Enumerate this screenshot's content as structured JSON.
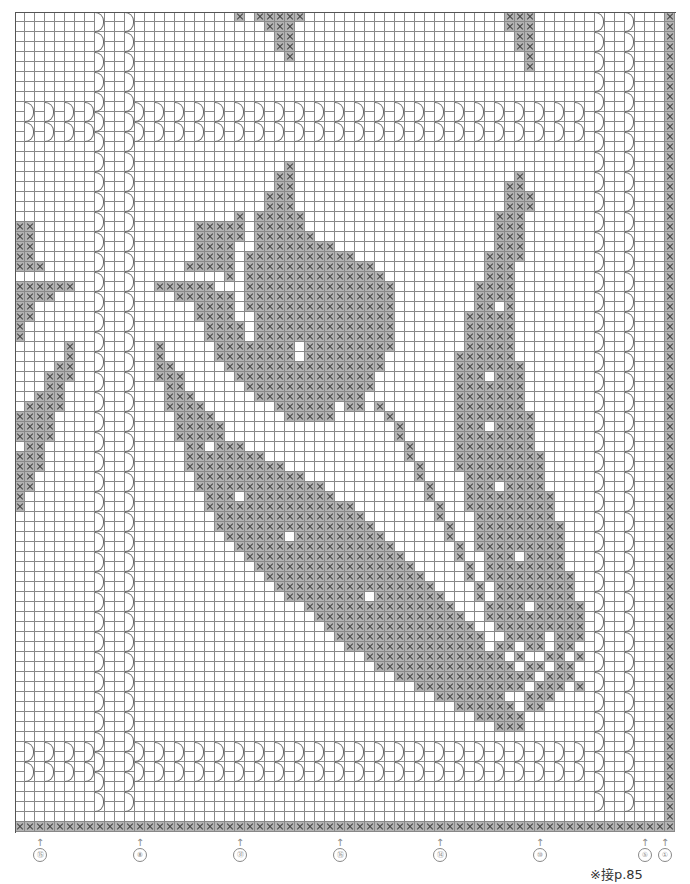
{
  "chart_info": {
    "type": "filet crochet chart",
    "cols": 66,
    "rows": 82,
    "cell_px": 10,
    "fill_color": "#b4b4b4",
    "line_color": "#888888"
  },
  "arch_columns": {
    "full_height": [
      8,
      11
    ],
    "top_band": {
      "rows": [
        9,
        12
      ],
      "cols": [
        1,
        3,
        5,
        7,
        12,
        14,
        16,
        18,
        20,
        22,
        24,
        26,
        28,
        30,
        32,
        34,
        36,
        38,
        40,
        42,
        44,
        46,
        48,
        50,
        52,
        54,
        56,
        58
      ]
    },
    "bottom_band": {
      "rows": [
        73,
        76
      ],
      "cols": [
        1,
        3,
        5,
        7,
        12,
        14,
        16,
        18,
        20,
        22,
        24,
        26,
        28,
        30,
        32,
        34,
        36,
        38,
        40,
        42,
        44,
        46,
        48,
        50,
        52,
        54,
        56,
        58
      ]
    },
    "right_full": [
      58,
      61
    ]
  },
  "filled_rows": {
    "0": [
      [
        22,
        22
      ],
      [
        24,
        28
      ],
      [
        49,
        51
      ]
    ],
    "1": [
      [
        25,
        27
      ],
      [
        49,
        51
      ]
    ],
    "2": [
      [
        26,
        27
      ],
      [
        50,
        51
      ]
    ],
    "3": [
      [
        26,
        27
      ],
      [
        50,
        51
      ]
    ],
    "4": [
      [
        27,
        27
      ],
      [
        51,
        51
      ]
    ],
    "5": [
      [
        51,
        51
      ]
    ],
    "15": [
      [
        27,
        27
      ]
    ],
    "16": [
      [
        26,
        27
      ],
      [
        50,
        50
      ]
    ],
    "17": [
      [
        26,
        27
      ],
      [
        49,
        50
      ]
    ],
    "18": [
      [
        25,
        27
      ],
      [
        49,
        51
      ]
    ],
    "19": [
      [
        25,
        27
      ],
      [
        49,
        51
      ]
    ],
    "20": [
      [
        22,
        22
      ],
      [
        24,
        28
      ],
      [
        48,
        50
      ]
    ],
    "21": [
      [
        0,
        1
      ],
      [
        18,
        22
      ],
      [
        24,
        28
      ],
      [
        48,
        50
      ]
    ],
    "22": [
      [
        0,
        1
      ],
      [
        18,
        22
      ],
      [
        24,
        29
      ],
      [
        48,
        50
      ]
    ],
    "23": [
      [
        0,
        1
      ],
      [
        18,
        21
      ],
      [
        24,
        31
      ],
      [
        48,
        50
      ]
    ],
    "24": [
      [
        0,
        1
      ],
      [
        18,
        21
      ],
      [
        23,
        33
      ],
      [
        47,
        50
      ]
    ],
    "25": [
      [
        0,
        2
      ],
      [
        17,
        21
      ],
      [
        23,
        35
      ],
      [
        47,
        49
      ]
    ],
    "26": [
      [
        21,
        21
      ],
      [
        23,
        36
      ],
      [
        47,
        49
      ]
    ],
    "27": [
      [
        0,
        5
      ],
      [
        14,
        19
      ],
      [
        23,
        37
      ],
      [
        46,
        49
      ]
    ],
    "28": [
      [
        0,
        3
      ],
      [
        16,
        21
      ],
      [
        23,
        37
      ],
      [
        46,
        49
      ]
    ],
    "29": [
      [
        0,
        1
      ],
      [
        18,
        21
      ],
      [
        23,
        37
      ],
      [
        46,
        47
      ],
      [
        49,
        49
      ]
    ],
    "30": [
      [
        0,
        1
      ],
      [
        18,
        21
      ],
      [
        24,
        37
      ],
      [
        45,
        49
      ]
    ],
    "31": [
      [
        0,
        0
      ],
      [
        19,
        22
      ],
      [
        24,
        37
      ],
      [
        45,
        49
      ]
    ],
    "32": [
      [
        0,
        0
      ],
      [
        19,
        22
      ],
      [
        24,
        37
      ],
      [
        45,
        49
      ]
    ],
    "33": [
      [
        5,
        5
      ],
      [
        14,
        14
      ],
      [
        20,
        27
      ],
      [
        29,
        37
      ],
      [
        45,
        49
      ]
    ],
    "34": [
      [
        5,
        5
      ],
      [
        14,
        14
      ],
      [
        20,
        27
      ],
      [
        29,
        36
      ],
      [
        44,
        49
      ]
    ],
    "35": [
      [
        4,
        5
      ],
      [
        14,
        15
      ],
      [
        21,
        36
      ],
      [
        44,
        50
      ]
    ],
    "36": [
      [
        3,
        5
      ],
      [
        14,
        16
      ],
      [
        22,
        35
      ],
      [
        44,
        46
      ],
      [
        48,
        50
      ]
    ],
    "37": [
      [
        3,
        4
      ],
      [
        15,
        16
      ],
      [
        23,
        35
      ],
      [
        44,
        50
      ]
    ],
    "38": [
      [
        2,
        4
      ],
      [
        15,
        17
      ],
      [
        24,
        34
      ],
      [
        44,
        50
      ]
    ],
    "39": [
      [
        1,
        4
      ],
      [
        15,
        18
      ],
      [
        26,
        31
      ],
      [
        33,
        34
      ],
      [
        36,
        36
      ],
      [
        44,
        50
      ]
    ],
    "40": [
      [
        0,
        3
      ],
      [
        16,
        19
      ],
      [
        27,
        31
      ],
      [
        37,
        37
      ],
      [
        44,
        51
      ]
    ],
    "41": [
      [
        0,
        3
      ],
      [
        16,
        20
      ],
      [
        38,
        38
      ],
      [
        44,
        46
      ],
      [
        48,
        51
      ]
    ],
    "42": [
      [
        0,
        3
      ],
      [
        16,
        20
      ],
      [
        38,
        38
      ],
      [
        44,
        51
      ]
    ],
    "43": [
      [
        1,
        2
      ],
      [
        17,
        18
      ],
      [
        20,
        22
      ],
      [
        39,
        39
      ],
      [
        44,
        51
      ]
    ],
    "44": [
      [
        0,
        2
      ],
      [
        17,
        24
      ],
      [
        39,
        39
      ],
      [
        44,
        52
      ]
    ],
    "45": [
      [
        0,
        2
      ],
      [
        17,
        26
      ],
      [
        40,
        40
      ],
      [
        44,
        52
      ]
    ],
    "46": [
      [
        0,
        1
      ],
      [
        18,
        28
      ],
      [
        40,
        40
      ],
      [
        45,
        52
      ]
    ],
    "47": [
      [
        0,
        1
      ],
      [
        18,
        30
      ],
      [
        41,
        41
      ],
      [
        45,
        47
      ],
      [
        49,
        52
      ]
    ],
    "48": [
      [
        0,
        0
      ],
      [
        19,
        21
      ],
      [
        23,
        31
      ],
      [
        41,
        41
      ],
      [
        45,
        53
      ]
    ],
    "49": [
      [
        0,
        0
      ],
      [
        19,
        33
      ],
      [
        42,
        42
      ],
      [
        45,
        53
      ]
    ],
    "50": [
      [
        20,
        34
      ],
      [
        42,
        42
      ],
      [
        46,
        53
      ]
    ],
    "51": [
      [
        20,
        35
      ],
      [
        43,
        43
      ],
      [
        46,
        54
      ]
    ],
    "52": [
      [
        21,
        26
      ],
      [
        28,
        36
      ],
      [
        43,
        43
      ],
      [
        46,
        54
      ]
    ],
    "53": [
      [
        22,
        37
      ],
      [
        44,
        44
      ],
      [
        46,
        54
      ]
    ],
    "54": [
      [
        23,
        38
      ],
      [
        44,
        44
      ],
      [
        47,
        49
      ],
      [
        51,
        54
      ]
    ],
    "55": [
      [
        24,
        39
      ],
      [
        45,
        45
      ],
      [
        47,
        54
      ]
    ],
    "56": [
      [
        25,
        40
      ],
      [
        45,
        45
      ],
      [
        47,
        55
      ]
    ],
    "57": [
      [
        26,
        41
      ],
      [
        46,
        46
      ],
      [
        48,
        55
      ]
    ],
    "58": [
      [
        27,
        34
      ],
      [
        36,
        42
      ],
      [
        46,
        46
      ],
      [
        48,
        55
      ]
    ],
    "59": [
      [
        29,
        43
      ],
      [
        47,
        47
      ],
      [
        48,
        50
      ],
      [
        52,
        56
      ]
    ],
    "60": [
      [
        30,
        44
      ],
      [
        47,
        56
      ]
    ],
    "61": [
      [
        31,
        45
      ],
      [
        48,
        56
      ]
    ],
    "62": [
      [
        32,
        46
      ],
      [
        49,
        52
      ],
      [
        54,
        56
      ]
    ],
    "63": [
      [
        33,
        46
      ],
      [
        48,
        49
      ],
      [
        51,
        52
      ],
      [
        54,
        55
      ]
    ],
    "64": [
      [
        35,
        48
      ],
      [
        50,
        50
      ],
      [
        53,
        54
      ],
      [
        56,
        56
      ]
    ],
    "65": [
      [
        36,
        49
      ],
      [
        51,
        52
      ],
      [
        54,
        55
      ]
    ],
    "66": [
      [
        38,
        51
      ],
      [
        53,
        55
      ]
    ],
    "67": [
      [
        40,
        50
      ],
      [
        52,
        54
      ],
      [
        56,
        56
      ]
    ],
    "68": [
      [
        42,
        48
      ],
      [
        51,
        53
      ]
    ],
    "69": [
      [
        44,
        49
      ],
      [
        51,
        52
      ]
    ],
    "70": [
      [
        46,
        50
      ]
    ],
    "71": [
      [
        48,
        50
      ]
    ],
    "81": [
      [
        0,
        65
      ]
    ]
  },
  "right_edge_column": 65,
  "markers": [
    {
      "x": 40,
      "label": "⑮"
    },
    {
      "x": 140,
      "label": "⑧"
    },
    {
      "x": 240,
      "label": "㉛"
    },
    {
      "x": 340,
      "label": "⑯"
    },
    {
      "x": 440,
      "label": "⑭"
    },
    {
      "x": 540,
      "label": "⑩"
    },
    {
      "x": 645,
      "label": "⑤"
    },
    {
      "x": 665,
      "label": "①"
    }
  ],
  "note": "※接p.85"
}
